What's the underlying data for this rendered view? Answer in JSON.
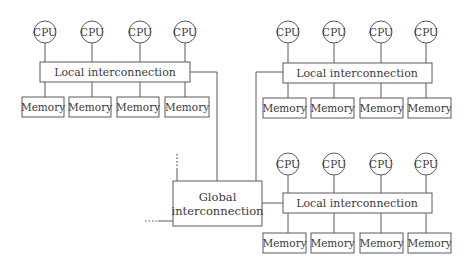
{
  "diagram": {
    "type": "hierarchical-multiprocessor-architecture",
    "groups": [
      {
        "id": "top-left",
        "cpus": [
          "CPU",
          "CPU",
          "CPU",
          "CPU"
        ],
        "interconnect_label": "Local interconnection",
        "memories": [
          "Memory",
          "Memory",
          "Memory",
          "Memory"
        ]
      },
      {
        "id": "top-right",
        "cpus": [
          "CPU",
          "CPU",
          "CPU",
          "CPU"
        ],
        "interconnect_label": "Local interconnection",
        "memories": [
          "Memory",
          "Memory",
          "Memory",
          "Memory"
        ]
      },
      {
        "id": "bottom-right",
        "cpus": [
          "CPU",
          "CPU",
          "CPU",
          "CPU"
        ],
        "interconnect_label": "Local interconnection",
        "memories": [
          "Memory",
          "Memory",
          "Memory",
          "Memory"
        ]
      }
    ],
    "global": {
      "label_line1": "Global",
      "label_line2": "interconnection"
    },
    "continuation_marks": [
      "vertical-ellipsis",
      "horizontal-ellipsis"
    ],
    "line_color": "#5a5a5a",
    "text_color": "#3a3a3a"
  }
}
